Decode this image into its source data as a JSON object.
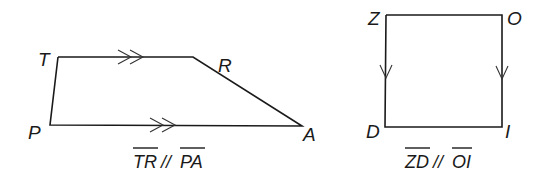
{
  "figures": [
    {
      "name": "trapezoid",
      "vertices": {
        "T": "T",
        "R": "R",
        "A": "A",
        "P": "P"
      },
      "caption": {
        "seg1": "TR",
        "rel": "//",
        "seg2": "PA"
      },
      "parallel_marks": "double-arrow"
    },
    {
      "name": "rectangle",
      "vertices": {
        "Z": "Z",
        "O": "O",
        "I": "I",
        "D": "D"
      },
      "caption": {
        "seg1": "ZD",
        "rel": "//",
        "seg2": "OI"
      },
      "parallel_marks": "single-arrow"
    }
  ],
  "colors": {
    "stroke": "#1a1a1a",
    "background": "#ffffff"
  }
}
